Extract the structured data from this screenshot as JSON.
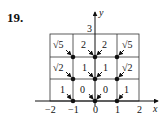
{
  "problem_number": "19.",
  "axes": {
    "x_label": "x",
    "y_label": "y",
    "x_ticks": [
      "−2",
      "−1",
      "0",
      "1",
      "2"
    ],
    "y_tick_top": "3"
  },
  "grid": {
    "rows": [
      [
        "√5",
        "2",
        "2",
        "√5"
      ],
      [
        "√2",
        "1",
        "1",
        "√2"
      ],
      [
        "1",
        "0",
        "0",
        "1"
      ]
    ]
  },
  "points": [
    {
      "x": -1,
      "y": 0
    },
    {
      "x": 0,
      "y": 0
    },
    {
      "x": 1,
      "y": 0
    },
    {
      "x": -1,
      "y": 1
    },
    {
      "x": 0,
      "y": 1
    },
    {
      "x": 1,
      "y": 1
    },
    {
      "x": -1,
      "y": 2
    },
    {
      "x": 0,
      "y": 2
    },
    {
      "x": 1,
      "y": 2
    }
  ]
}
